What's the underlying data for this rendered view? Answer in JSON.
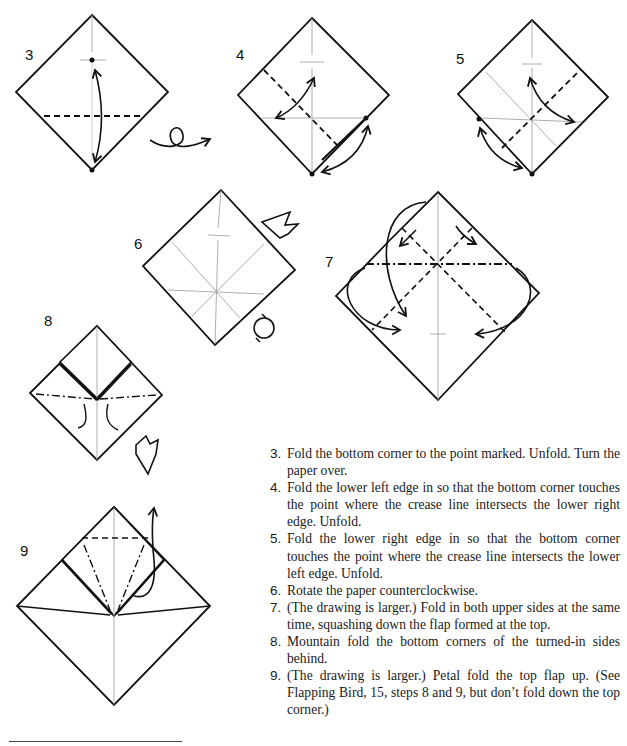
{
  "diagram": {
    "steps": [
      {
        "number": "3",
        "label_pos": [
          25,
          53
        ]
      },
      {
        "number": "4",
        "label_pos": [
          236,
          53
        ]
      },
      {
        "number": "5",
        "label_pos": [
          456,
          57
        ]
      },
      {
        "number": "6",
        "label_pos": [
          134,
          242
        ]
      },
      {
        "number": "7",
        "label_pos": [
          325,
          260
        ]
      },
      {
        "number": "8",
        "label_pos": [
          44,
          319
        ]
      },
      {
        "number": "9",
        "label_pos": [
          20,
          549
        ]
      }
    ],
    "symbols": [
      "turn-over-arrow",
      "rotate-counterclockwise-symbol",
      "enlarge-symbol",
      "push-arrow",
      "valley-fold-line",
      "mountain-fold-line",
      "crease-line",
      "reference-point"
    ]
  },
  "instructions": [
    {
      "num": "3.",
      "text": "Fold the bottom corner to the point marked. Unfold. Turn the paper over."
    },
    {
      "num": "4.",
      "text": "Fold the lower left edge in so that the bottom corner touches the point where the crease line intersects the lower right edge. Unfold."
    },
    {
      "num": "5.",
      "text": "Fold the lower right edge in so that the bottom corner touches the point where the crease line intersects the lower left edge. Unfold."
    },
    {
      "num": "6.",
      "text": "Rotate the paper counterclockwise."
    },
    {
      "num": "7.",
      "text": "(The drawing is larger.) Fold in both upper sides at the same time, squashing down the flap formed at the top."
    },
    {
      "num": "8.",
      "text": "Mountain fold the bottom corners of the turned-in sides behind."
    },
    {
      "num": "9.",
      "text": "(The drawing is larger.) Petal fold the top flap up. (See Flapping Bird, 15, steps 8 and 9, but don’t fold down the top corner.)"
    }
  ],
  "colors": {
    "ink": "#111111",
    "crease": "#9a9a9a",
    "paper": "#ffffff"
  }
}
